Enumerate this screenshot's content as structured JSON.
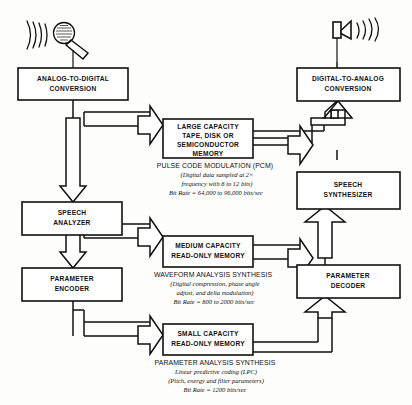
{
  "diagram": {
    "input_icon": "microphone-icon",
    "output_icon": "speaker-icon",
    "left_blocks": [
      {
        "id": "adc",
        "line1": "ANALOG-TO-DIGITAL",
        "line2": "CONVERSION"
      },
      {
        "id": "analyzer",
        "line1": "SPEECH",
        "line2": "ANALYZER"
      },
      {
        "id": "encoder",
        "line1": "PARAMETER",
        "line2": "ENCODER"
      }
    ],
    "center_blocks": [
      {
        "id": "large",
        "line1": "LARGE CAPACITY",
        "line2": "TAPE, DISK OR",
        "line3": "SEMICONDUCTOR",
        "line4": "MEMORY"
      },
      {
        "id": "medium",
        "line1": "MEDIUM CAPACITY",
        "line2": "READ-ONLY MEMORY"
      },
      {
        "id": "small",
        "line1": "SMALL CAPACITY",
        "line2": "READ-ONLY MEMORY"
      }
    ],
    "right_blocks": [
      {
        "id": "dac",
        "line1": "DIGITAL-TO-ANALOG",
        "line2": "CONVERSION"
      },
      {
        "id": "synthesizer",
        "line1": "SPEECH",
        "line2": "SYNTHESIZER"
      },
      {
        "id": "decoder",
        "line1": "PARAMETER",
        "line2": "DECODER"
      }
    ],
    "annotations": [
      {
        "id": "pcm",
        "heading": "PULSE CODE MODULATION (PCM)",
        "detail1": "(Digital data sampled at 2×",
        "detail2": "frequency with 8 to 12 bits)",
        "bitrate": "Bit Rate  =  64,000 to 96,000 bits/sec"
      },
      {
        "id": "waveform",
        "heading": "WAVEFORM ANALYSIS SYNTHESIS",
        "detail1": "(Digital compression, phase angle",
        "detail2": "adjust, and delta modulation)",
        "bitrate": "Bit Rate  =  800 to 2000 bits/sec"
      },
      {
        "id": "parameter",
        "heading": "PARAMETER ANALYSIS SYNTHESIS",
        "detail1": "Linear predictive coding (LPC)",
        "detail2": "(Pitch, energy and filter parameters)",
        "bitrate": "Bit Rate  =  1200 bits/sec"
      }
    ],
    "colors": {
      "ink": "#111111",
      "paper": "#fdfdfb"
    }
  }
}
